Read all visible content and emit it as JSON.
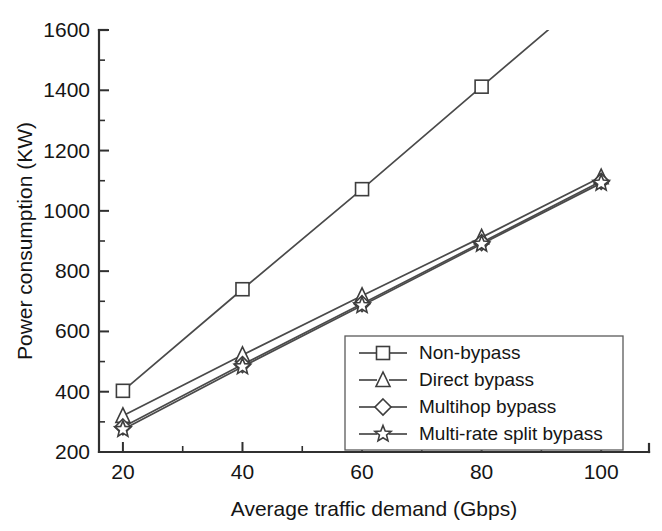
{
  "chart_data": {
    "type": "line",
    "title": "",
    "xlabel": "Average traffic demand (Gbps)",
    "ylabel": "Power consumption (KW)",
    "x": [
      20,
      40,
      60,
      80,
      100
    ],
    "xlim": [
      16,
      108
    ],
    "ylim": [
      200,
      1600
    ],
    "xticks": [
      20,
      40,
      60,
      80,
      100
    ],
    "yticks": [
      200,
      400,
      600,
      800,
      1000,
      1200,
      1400,
      1600
    ],
    "xtick_labels": [
      "20",
      "40",
      "60",
      "80",
      "100"
    ],
    "ytick_labels": [
      "200",
      "400",
      "600",
      "800",
      "1000",
      "1200",
      "1400",
      "1600"
    ],
    "minor_ticks": true,
    "grid": false,
    "legend_position": "lower right",
    "series": [
      {
        "name": "Non-bypass",
        "marker": "square",
        "values": [
          403,
          740,
          1072,
          1412,
          1750
        ]
      },
      {
        "name": "Direct bypass",
        "marker": "triangle",
        "values": [
          320,
          522,
          718,
          912,
          1112
        ]
      },
      {
        "name": "Multihop bypass",
        "marker": "diamond",
        "values": [
          283,
          490,
          692,
          895,
          1098
        ]
      },
      {
        "name": "Multi-rate split bypass",
        "marker": "star",
        "values": [
          275,
          483,
          686,
          890,
          1092
        ]
      }
    ]
  },
  "legend": {
    "entries": [
      {
        "label": "Non-bypass",
        "marker": "square"
      },
      {
        "label": "Direct bypass",
        "marker": "triangle"
      },
      {
        "label": "Multihop bypass",
        "marker": "diamond"
      },
      {
        "label": "Multi-rate split bypass",
        "marker": "star"
      }
    ]
  }
}
